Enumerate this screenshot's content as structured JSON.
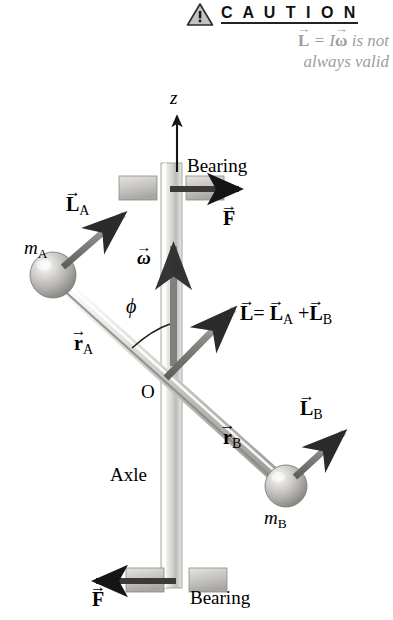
{
  "caution": {
    "icon": "warning-triangle-icon",
    "title": "C A U T I O N",
    "line1_lhs": "L",
    "line1_eq": "=",
    "line1_I": "I",
    "line1_omega": "ω",
    "line1_tail": "is not",
    "line2": "always valid",
    "text_color": "#9d9d9d"
  },
  "diagram": {
    "axis_z": "z",
    "bearing_top": "Bearing",
    "bearing_bottom": "Bearing",
    "axle": "Axle",
    "origin": "O",
    "angle_phi": "ϕ",
    "omega": "ω",
    "force_top": "F",
    "force_bottom": "F",
    "mass_a": "m",
    "mass_a_sub": "A",
    "mass_b": "m",
    "mass_b_sub": "B",
    "r_a": "r",
    "r_a_sub": "A",
    "r_b": "r",
    "r_b_sub": "B",
    "l_a": "L",
    "l_a_sub": "A",
    "l_b": "L",
    "l_b_sub": "B",
    "l_total": "L",
    "l_total_eq": "=",
    "l_total_term1": "L",
    "l_total_term1_sub": "A",
    "l_total_plus": "+",
    "l_total_term2": "L",
    "l_total_term2_sub": "B"
  },
  "colors": {
    "background": "#ffffff",
    "ink": "#000000",
    "metal_light": "#f2f1ef",
    "metal_mid": "#c9c7c4",
    "metal_dark": "#8e8c89",
    "arrow_gray": "#6f6e6c",
    "arrow_dark": "#3a3a3a",
    "caution_gray": "#9d9d9d"
  }
}
